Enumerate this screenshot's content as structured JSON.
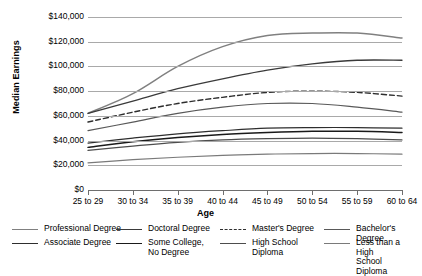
{
  "chart_data": {
    "type": "line",
    "title": "",
    "xlabel": "Age",
    "ylabel": "Median Earnings",
    "categories": [
      "25 to 29",
      "30 to 34",
      "35 to 39",
      "40 to 44",
      "45 to 49",
      "50 to 54",
      "55 to 59",
      "60 to 64"
    ],
    "ylim": [
      0,
      140000
    ],
    "yticks": [
      "$0",
      "$20,000",
      "$40,000",
      "$60,000",
      "$80,000",
      "$100,000",
      "$120,000",
      "$140,000"
    ],
    "ytick_values": [
      0,
      20000,
      40000,
      60000,
      80000,
      100000,
      120000,
      140000
    ],
    "grid": true,
    "legend_position": "bottom",
    "series": [
      {
        "name": "Professional Degree",
        "color": "#808080",
        "width": 1.5,
        "dash": "none",
        "values": [
          62000,
          78000,
          100000,
          116000,
          125000,
          127000,
          127000,
          123000
        ]
      },
      {
        "name": "Doctoral Degree",
        "color": "#3a3a3a",
        "width": 1.3,
        "dash": "none",
        "values": [
          62000,
          72000,
          82000,
          90000,
          97000,
          102000,
          105000,
          105000
        ]
      },
      {
        "name": "Master's Degree",
        "color": "#2e2e2e",
        "width": 1.4,
        "dash": "dashed",
        "values": [
          55000,
          63000,
          70000,
          75000,
          79000,
          80000,
          79000,
          76000
        ]
      },
      {
        "name": "Bachelor's Degree",
        "color": "#595959",
        "width": 1.2,
        "dash": "none",
        "values": [
          48000,
          55000,
          62000,
          67000,
          70000,
          70000,
          67000,
          63000
        ]
      },
      {
        "name": "Associate Degree",
        "color": "#2e2e2e",
        "width": 1.2,
        "dash": "none",
        "values": [
          38000,
          42000,
          45500,
          48000,
          50000,
          50500,
          50500,
          50000
        ]
      },
      {
        "name": "Some College, No Degree",
        "color": "#1a1a1a",
        "width": 1.5,
        "dash": "none",
        "values": [
          34500,
          39000,
          42500,
          45000,
          46500,
          47500,
          47500,
          46500
        ]
      },
      {
        "name": "High School Diploma",
        "color": "#4d4d4d",
        "width": 1.2,
        "dash": "none",
        "values": [
          32000,
          35500,
          38500,
          40500,
          41500,
          42000,
          41500,
          40500
        ]
      },
      {
        "name": "Less than a High School Diploma",
        "color": "#7a7a7a",
        "width": 1.2,
        "dash": "none",
        "values": [
          22000,
          24500,
          26500,
          28000,
          29000,
          29500,
          29500,
          29000
        ]
      }
    ]
  },
  "legend": {
    "items": [
      {
        "label": "Professional Degree",
        "series": 0
      },
      {
        "label": "Doctoral Degree",
        "series": 1
      },
      {
        "label": "Master's Degree",
        "series": 2
      },
      {
        "label": "Bachelor's Degree",
        "series": 3
      },
      {
        "label": "Associate Degree",
        "series": 4
      },
      {
        "label": "Some College,\nNo Degree",
        "series": 5
      },
      {
        "label": "High School\nDiploma",
        "series": 6
      },
      {
        "label": "Less than a High\nSchool Diploma",
        "series": 7
      }
    ]
  }
}
